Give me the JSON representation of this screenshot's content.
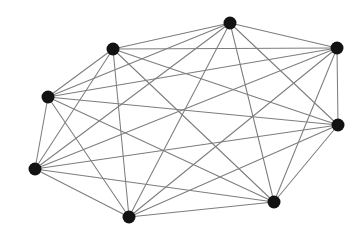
{
  "figure": {
    "kind": "graph-drawing",
    "width": 364,
    "height": 227,
    "background_color": "#ffffff"
  },
  "style": {
    "edge_color": "#7d7d7d",
    "edge_width": 1.05,
    "vertex_color": "#121212",
    "vertex_radius": 6.5
  },
  "chart_data": {
    "type": "scatter",
    "subtitle": "",
    "xlabel": "",
    "ylabel": "",
    "xlim": [
      0,
      364
    ],
    "ylim": [
      0,
      227
    ],
    "grid": false,
    "legend": "none",
    "annotations": [],
    "tick_labels": {
      "x": [],
      "y": []
    },
    "graph": {
      "directed": false,
      "vertex_count": 8,
      "edge_count": 28,
      "degree_sequence": [
        7,
        7,
        7,
        7,
        7,
        7,
        7,
        7
      ],
      "is_complete": true,
      "nodes": [
        {
          "id": "v1",
          "label": "",
          "x": 230,
          "y": 23
        },
        {
          "id": "v2",
          "label": "",
          "x": 337,
          "y": 48
        },
        {
          "id": "v3",
          "label": "",
          "x": 113,
          "y": 49
        },
        {
          "id": "v4",
          "label": "",
          "x": 48,
          "y": 97
        },
        {
          "id": "v5",
          "label": "",
          "x": 338,
          "y": 125
        },
        {
          "id": "v6",
          "label": "",
          "x": 35,
          "y": 169
        },
        {
          "id": "v7",
          "label": "",
          "x": 274,
          "y": 202
        },
        {
          "id": "v8",
          "label": "",
          "x": 129,
          "y": 217
        }
      ],
      "edges": [
        [
          "v1",
          "v2"
        ],
        [
          "v1",
          "v3"
        ],
        [
          "v1",
          "v4"
        ],
        [
          "v1",
          "v5"
        ],
        [
          "v1",
          "v6"
        ],
        [
          "v1",
          "v7"
        ],
        [
          "v1",
          "v8"
        ],
        [
          "v2",
          "v3"
        ],
        [
          "v2",
          "v4"
        ],
        [
          "v2",
          "v5"
        ],
        [
          "v2",
          "v6"
        ],
        [
          "v2",
          "v7"
        ],
        [
          "v2",
          "v8"
        ],
        [
          "v3",
          "v4"
        ],
        [
          "v3",
          "v5"
        ],
        [
          "v3",
          "v6"
        ],
        [
          "v3",
          "v7"
        ],
        [
          "v3",
          "v8"
        ],
        [
          "v4",
          "v5"
        ],
        [
          "v4",
          "v6"
        ],
        [
          "v4",
          "v7"
        ],
        [
          "v4",
          "v8"
        ],
        [
          "v5",
          "v6"
        ],
        [
          "v5",
          "v7"
        ],
        [
          "v5",
          "v8"
        ],
        [
          "v6",
          "v7"
        ],
        [
          "v6",
          "v8"
        ],
        [
          "v7",
          "v8"
        ]
      ]
    }
  }
}
